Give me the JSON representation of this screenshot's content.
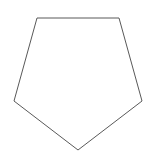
{
  "canvas": {
    "width": 153,
    "height": 158,
    "background_color": "#ffffff",
    "name": "pentagon-diagram"
  },
  "shape": {
    "label": "pentagon",
    "type": "polygon",
    "sides": 5,
    "stroke_color": "#595959",
    "stroke_width": 1,
    "fill_color": "none",
    "points": "37,18 119,18 142,101 78,150 14,101",
    "vertices": [
      {
        "name": "top-left-vertex",
        "x": 37,
        "y": 18
      },
      {
        "name": "top-right-vertex",
        "x": 119,
        "y": 18
      },
      {
        "name": "right-vertex",
        "x": 142,
        "y": 101
      },
      {
        "name": "bottom-vertex",
        "x": 78,
        "y": 150
      },
      {
        "name": "left-vertex",
        "x": 14,
        "y": 101
      }
    ],
    "edges": [
      {
        "name": "top-edge",
        "from": [
          37,
          18
        ],
        "to": [
          119,
          18
        ]
      },
      {
        "name": "upper-right-edge",
        "from": [
          119,
          18
        ],
        "to": [
          142,
          101
        ]
      },
      {
        "name": "lower-right-edge",
        "from": [
          142,
          101
        ],
        "to": [
          78,
          150
        ]
      },
      {
        "name": "lower-left-edge",
        "from": [
          78,
          150
        ],
        "to": [
          14,
          101
        ]
      },
      {
        "name": "upper-left-edge",
        "from": [
          14,
          101
        ],
        "to": [
          37,
          18
        ]
      }
    ]
  }
}
